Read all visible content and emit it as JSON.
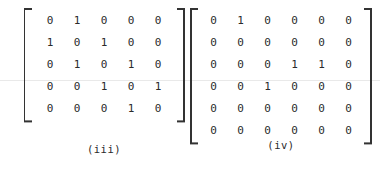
{
  "page": {
    "background_color": "#ffffff",
    "text_color": "#2b2b2b",
    "bracket_color": "#333333",
    "scanline_color": "#e9e9e9"
  },
  "figures": [
    {
      "id": "matrix-iii",
      "caption": "(iii)",
      "rows": 5,
      "cols": 5,
      "values": [
        [
          0,
          1,
          0,
          0,
          0
        ],
        [
          1,
          0,
          1,
          0,
          0
        ],
        [
          0,
          1,
          0,
          1,
          0
        ],
        [
          0,
          0,
          1,
          0,
          1
        ],
        [
          0,
          0,
          0,
          1,
          0
        ]
      ]
    },
    {
      "id": "matrix-iv",
      "caption": "(iv)",
      "rows": 6,
      "cols": 6,
      "values": [
        [
          0,
          1,
          0,
          0,
          0,
          0
        ],
        [
          0,
          0,
          0,
          0,
          0,
          0
        ],
        [
          0,
          0,
          0,
          1,
          1,
          0
        ],
        [
          0,
          0,
          1,
          0,
          0,
          0
        ],
        [
          0,
          0,
          0,
          0,
          0,
          0
        ],
        [
          0,
          0,
          0,
          0,
          0,
          0
        ]
      ]
    }
  ]
}
